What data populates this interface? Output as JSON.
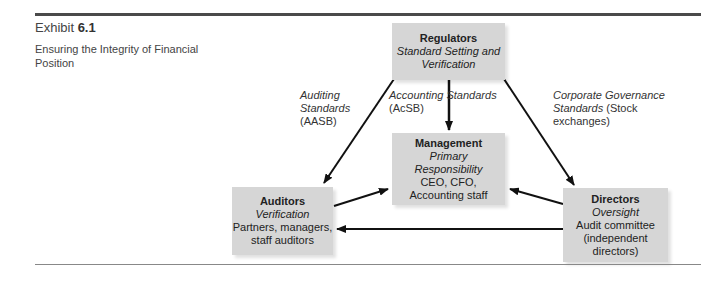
{
  "exhibit": {
    "prefix": "Exhibit ",
    "number": "6.1"
  },
  "caption": "Ensuring the Integrity of Financial Position",
  "nodes": {
    "regulators": {
      "title": "Regulators",
      "role": "Standard Setting and Verification",
      "detail": ""
    },
    "management": {
      "title": "Management",
      "role": "Primary Responsibility",
      "detail": "CEO, CFO, Accounting staff"
    },
    "auditors": {
      "title": "Auditors",
      "role": "Verification",
      "detail": "Partners, managers, staff auditors"
    },
    "directors": {
      "title": "Directors",
      "role": "Oversight",
      "detail": "Audit committee (independent directors)"
    }
  },
  "edges": {
    "auditing": {
      "italic": "Auditing Standards",
      "plain": "(AASB)"
    },
    "accounting": {
      "italic": "Accounting Standards",
      "plain": "(AcSB)"
    },
    "governance": {
      "italic": "Corporate Governance Standards",
      "plain": "(Stock exchanges)"
    }
  },
  "colors": {
    "box_fill": "#d6d6d6",
    "line": "#111111",
    "rule": "#4a4a4a"
  }
}
